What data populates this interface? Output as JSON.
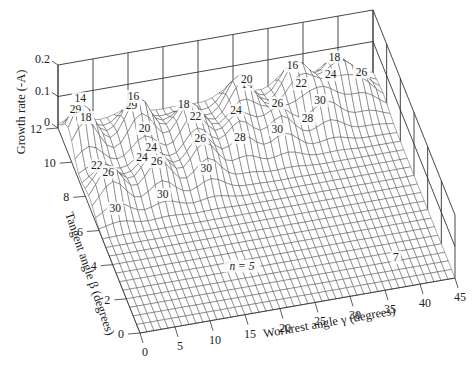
{
  "chart_data": {
    "type": "surface3d",
    "title": "",
    "xlabel": "Workrest angle γ (degrees)",
    "ylabel": "Tangent angle β (degrees)",
    "zlabel": "Growth rate (-A)",
    "x_ticks": [
      "0",
      "5",
      "10",
      "15",
      "20",
      "25",
      "30",
      "35",
      "40",
      "45"
    ],
    "y_ticks": [
      "0",
      "2",
      "4",
      "6",
      "8",
      "10",
      "12"
    ],
    "z_ticks": [
      "0",
      "0.1",
      "0.2"
    ],
    "xlim": [
      0,
      45
    ],
    "ylim": [
      0,
      12
    ],
    "zlim": [
      0,
      0.2
    ],
    "grid": true,
    "annotations": [
      {
        "text": "n = 5",
        "x": 17,
        "y": 2.5
      },
      {
        "text": "7",
        "x": 38,
        "y": 1.5
      }
    ],
    "peak_labels": [
      {
        "text": "29",
        "x": 2,
        "y": 11.5
      },
      {
        "text": "14",
        "x": 2,
        "y": 10.8
      },
      {
        "text": "18",
        "x": 2,
        "y": 10
      },
      {
        "text": "22",
        "x": 2.2,
        "y": 8.6
      },
      {
        "text": "26",
        "x": 2.5,
        "y": 7.2
      },
      {
        "text": "30",
        "x": 2.6,
        "y": 6.3
      },
      {
        "text": "29",
        "x": 10.5,
        "y": 12
      },
      {
        "text": "16",
        "x": 10,
        "y": 11.2
      },
      {
        "text": "20",
        "x": 10,
        "y": 9.6
      },
      {
        "text": "24",
        "x": 9.8,
        "y": 8.4
      },
      {
        "text": "24",
        "x": 8.4,
        "y": 8.3
      },
      {
        "text": "26",
        "x": 9.6,
        "y": 7.4
      },
      {
        "text": "30",
        "x": 9.7,
        "y": 6.6
      },
      {
        "text": "18",
        "x": 17,
        "y": 11
      },
      {
        "text": "22",
        "x": 17,
        "y": 9.3
      },
      {
        "text": "26",
        "x": 16.5,
        "y": 8.1
      },
      {
        "text": "30",
        "x": 16.5,
        "y": 7.2
      },
      {
        "text": "14",
        "x": 27,
        "y": 12
      },
      {
        "text": "20",
        "x": 25.5,
        "y": 10.5
      },
      {
        "text": "24",
        "x": 23,
        "y": 9.5
      },
      {
        "text": "28",
        "x": 22.5,
        "y": 8.4
      },
      {
        "text": "16",
        "x": 33.5,
        "y": 12
      },
      {
        "text": "22",
        "x": 33,
        "y": 10.2
      },
      {
        "text": "26",
        "x": 29,
        "y": 9.6
      },
      {
        "text": "30",
        "x": 28,
        "y": 8.6
      },
      {
        "text": "18",
        "x": 39.5,
        "y": 12
      },
      {
        "text": "24",
        "x": 37.5,
        "y": 10.5
      },
      {
        "text": "30",
        "x": 35,
        "y": 9.5
      },
      {
        "text": "26",
        "x": 42,
        "y": 10.6
      },
      {
        "text": "28",
        "x": 33,
        "y": 9.3
      }
    ],
    "surface_description": "Growth rate peaks (about 0.1-0.15) form ridges at high tangent angle (beta > 6 deg) for workrest angles below about 42 deg; surface is flat near 0 for beta below about 6 deg.",
    "peaks": [
      {
        "x": 2,
        "y": 10.5,
        "z": 0.15
      },
      {
        "x": 10,
        "y": 10.5,
        "z": 0.14
      },
      {
        "x": 17,
        "y": 10.0,
        "z": 0.12
      },
      {
        "x": 25,
        "y": 10.8,
        "z": 0.13
      },
      {
        "x": 33,
        "y": 11.0,
        "z": 0.13
      },
      {
        "x": 39,
        "y": 11.2,
        "z": 0.1
      },
      {
        "x": 3,
        "y": 7.5,
        "z": 0.11
      },
      {
        "x": 10,
        "y": 7.8,
        "z": 0.11
      },
      {
        "x": 17,
        "y": 8.0,
        "z": 0.1
      },
      {
        "x": 23,
        "y": 9.0,
        "z": 0.09
      },
      {
        "x": 29,
        "y": 9.2,
        "z": 0.09
      },
      {
        "x": 36,
        "y": 9.8,
        "z": 0.08
      },
      {
        "x": 42,
        "y": 10.5,
        "z": 0.06
      }
    ]
  }
}
